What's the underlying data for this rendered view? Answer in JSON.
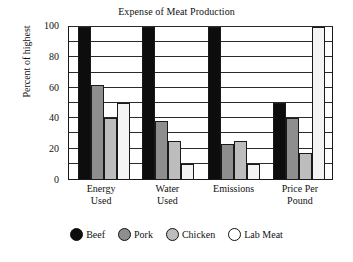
{
  "chart_data": {
    "type": "bar",
    "title": "Expense of Meat Production",
    "xlabel": "",
    "ylabel": "Percent of highest",
    "categories": [
      "Energy\nUsed",
      "Water\nUsed",
      "Emissions",
      "Price Per\nPound"
    ],
    "category_labels": [
      {
        "line1": "Energy",
        "line2": "Used"
      },
      {
        "line1": "Water",
        "line2": "Used"
      },
      {
        "line1": "Emissions",
        "line2": ""
      },
      {
        "line1": "Price Per",
        "line2": "Pound"
      }
    ],
    "series": [
      {
        "name": "Beef",
        "color": "#0d0d0d",
        "values": [
          100,
          100,
          100,
          50
        ]
      },
      {
        "name": "Pork",
        "color": "#8e8e8e",
        "values": [
          62,
          38,
          23,
          40
        ]
      },
      {
        "name": "Chicken",
        "color": "#bdbdbd",
        "values": [
          40,
          25,
          25,
          17
        ]
      },
      {
        "name": "Lab Meat",
        "color": "#ffffff",
        "values": [
          50,
          10,
          10,
          100
        ]
      }
    ],
    "ylim": [
      0,
      100
    ],
    "yticks": [
      0,
      20,
      40,
      60,
      80,
      100
    ],
    "ytick_labels": [
      "0",
      "20",
      "40",
      "60",
      "80",
      "100"
    ],
    "gridlines": [
      10,
      20,
      30,
      40,
      50,
      60,
      70,
      80,
      90,
      100
    ],
    "grid": true,
    "legend_position": "bottom"
  }
}
